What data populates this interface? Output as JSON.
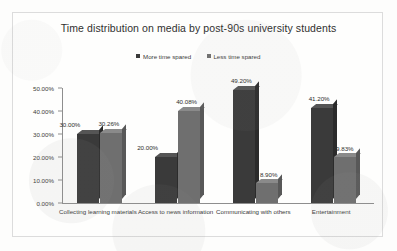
{
  "chart_data": {
    "type": "bar",
    "title": "Time distribution on media by post-90s university students",
    "xlabel": "",
    "ylabel": "",
    "ylim": [
      0,
      50
    ],
    "grid": false,
    "legend_position": "top-center",
    "categories": [
      "Collecting learning materials",
      "Access to news information",
      "Communicating with others",
      "Entertainment"
    ],
    "y_tick_labels": [
      "0.00%",
      "10.00%",
      "20.00%",
      "30.00%",
      "40.00%",
      "50.00%"
    ],
    "y_tick_values": [
      0,
      10,
      20,
      30,
      40,
      50
    ],
    "series": [
      {
        "name": "More time spared",
        "color": "#3a3a3a",
        "values": [
          30.0,
          20.0,
          49.2,
          41.2
        ],
        "labels": [
          "30.00%",
          "20.00%",
          "49.20%",
          "41.20%"
        ]
      },
      {
        "name": "Less time spared",
        "color": "#6f6f6f",
        "values": [
          30.26,
          40.08,
          8.9,
          19.83
        ],
        "labels": [
          "30.26%",
          "40.08%",
          "8.90%",
          "19.83%"
        ]
      }
    ]
  },
  "colors": {
    "series_more": "#3a3a3a",
    "series_less": "#6f6f6f",
    "frame": "#dcdcdc",
    "axis": "#8e8e8e",
    "text": "#3b3b3a"
  }
}
